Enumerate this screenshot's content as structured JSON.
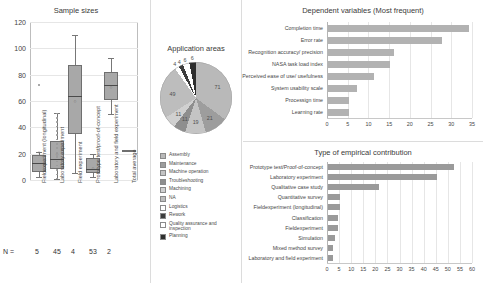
{
  "chart_data": [
    {
      "type": "boxplot",
      "title": "Sample sizes",
      "xlabel": "",
      "ylabel": "",
      "ylim": [
        0,
        120
      ],
      "yticks": [
        0,
        20,
        40,
        60,
        80,
        100,
        120
      ],
      "grid": true,
      "n_label": "N =",
      "categories": [
        "Fieldexperiment (longitudinal)",
        "Laboratory experiment",
        "Field experiment",
        "Prototype test/proof-of-concept",
        "Laboratory and field experiment",
        "Total average"
      ],
      "n_values": [
        "5",
        "45",
        "4",
        "53",
        "2",
        ""
      ],
      "boxes": [
        {
          "category": "Fieldexperiment (longitudinal)",
          "min": 2,
          "q1": 6,
          "median": 13,
          "q3": 19,
          "max": 21,
          "mean": 21,
          "outliers": [
            72
          ]
        },
        {
          "category": "Laboratory experiment",
          "min": 1,
          "q1": 8,
          "median": 16,
          "q3": 30,
          "max": 51,
          "mean": 20,
          "outliers": []
        },
        {
          "category": "Field experiment",
          "min": 5,
          "q1": 35,
          "median": 64,
          "q3": 87,
          "max": 110,
          "mean": 60,
          "outliers": []
        },
        {
          "category": "Prototype test/proof-of-concept",
          "min": 2,
          "q1": 5,
          "median": 8,
          "q3": 17,
          "max": 20,
          "mean": 9,
          "outliers": []
        },
        {
          "category": "Laboratory and field experiment",
          "min": 50,
          "q1": 61,
          "median": 72,
          "q3": 82,
          "max": 93,
          "mean": 71,
          "outliers": []
        },
        {
          "category": "Total average",
          "min": 23,
          "q1": 23,
          "median": 23,
          "q3": 23,
          "max": 23,
          "mean": 23,
          "outliers": []
        }
      ]
    },
    {
      "type": "pie",
      "title": "Application areas",
      "legend_position": "bottom",
      "labels": [
        "Assembly",
        "Maintenance",
        "Machine operation",
        "Troubleshooting",
        "Machining",
        "NA",
        "Logistics",
        "Rework",
        "Quality assurance and inspection",
        "Planning"
      ],
      "values": [
        71,
        21,
        19,
        11,
        11,
        49,
        4,
        4,
        6,
        6
      ],
      "slice_labels": [
        "71",
        "21",
        "19",
        "11",
        "11",
        "49",
        "4",
        "4",
        "6",
        "6"
      ],
      "colors": [
        "#b9b9b9",
        "#9d9d9d",
        "#c4c4c4",
        "#8e8e8e",
        "#d0d0d0",
        "#bdbdbd",
        "#ffffff",
        "#3d3d3d",
        "#ffffff",
        "#2e2e2e"
      ]
    },
    {
      "type": "bar",
      "orientation": "horizontal",
      "title": "Dependent variables (Most frequent)",
      "categories": [
        "Completion time",
        "Error rate",
        "Recognition accuracy/ precision",
        "NASA task load index",
        "Perceived ease of use/ usefulness",
        "System usability scale",
        "Processign time",
        "Learning rate"
      ],
      "values": [
        34,
        27.5,
        16,
        15,
        11,
        7,
        5,
        5
      ],
      "xlim": [
        0,
        35
      ],
      "xticks": [
        0,
        5,
        10,
        15,
        20,
        25,
        30,
        35
      ],
      "grid": true,
      "bar_color": "#b2b2b2"
    },
    {
      "type": "bar",
      "orientation": "horizontal",
      "title": "Type of empirical contribution",
      "categories": [
        "Prototype test/Proof-of-concept",
        "Laboratory experiment",
        "Qualitative case study",
        "Quantitative survey",
        "Fieldexperiment (longitudinal)",
        "Classification",
        "Fieldexperiment",
        "Simulation",
        "Mixed method survey",
        "Laboratory and field experiment"
      ],
      "values": [
        52,
        45,
        21,
        5,
        5,
        4,
        4,
        3,
        2,
        2
      ],
      "xlim": [
        0,
        60
      ],
      "xticks": [
        0,
        5,
        10,
        15,
        20,
        25,
        30,
        35,
        40,
        45,
        50,
        55,
        60
      ],
      "grid": true,
      "bar_color": "#9a9a9a"
    }
  ]
}
